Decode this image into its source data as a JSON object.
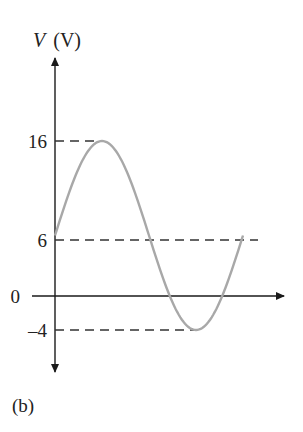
{
  "figure": {
    "panel_label": "(b)",
    "y_axis_label_var": "V",
    "y_axis_label_unit": "(V)"
  },
  "colors": {
    "axis": "#1a1a1a",
    "curve": "#a8a8a8",
    "dash": "#333333",
    "text": "#222222"
  },
  "chart_data": {
    "type": "line",
    "title": "",
    "xlabel": "",
    "ylabel": "V (V)",
    "yticks": [
      16,
      6,
      0,
      -4
    ],
    "ytick_labels": [
      "16",
      "6",
      "0",
      "–4"
    ],
    "reference_lines": [
      {
        "y": 16,
        "style": "dashed",
        "label": "16"
      },
      {
        "y": 6,
        "style": "dashed",
        "label": "6"
      },
      {
        "y": -4,
        "style": "dashed",
        "label": "–4"
      }
    ],
    "series": [
      {
        "name": "V(t) = 6 + 10 sin(ωt)",
        "description": "One full cycle of a sinusoid with DC offset 6 V and amplitude 10 V",
        "offset": 6,
        "amplitude": 10,
        "max": 16,
        "min": -4,
        "cycles": 1,
        "x": [
          0,
          0.25,
          0.5,
          0.75,
          1.0
        ],
        "values": [
          6,
          16,
          6,
          -4,
          6
        ]
      }
    ],
    "ylim": [
      -8,
      28
    ],
    "grid": false,
    "legend": null
  }
}
